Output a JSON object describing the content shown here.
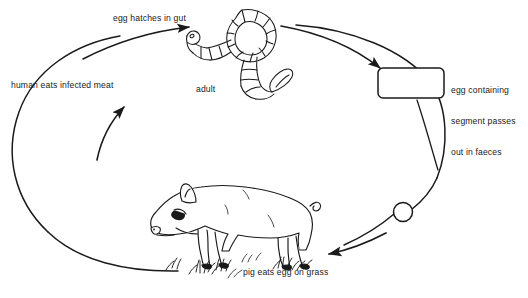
{
  "diagram": {
    "type": "cycle-diagram",
    "background_color": "#ffffff",
    "stroke_color": "#1a1a1a",
    "labels": {
      "egg_hatches": "egg hatches in gut",
      "human_eats": "human eats infected meat",
      "adult": "adult",
      "egg_segment_line1": "egg containing",
      "egg_segment_line2": "segment passes",
      "egg_segment_line3": "out in faeces",
      "pig_eats": "pig eats egg on grass"
    },
    "nodes": [
      {
        "name": "adult-tapeworm",
        "label": "adult",
        "shape": "coiled-segmented-worm"
      },
      {
        "name": "proglottid-segment",
        "label": "egg containing segment passes out in faeces",
        "shape": "rounded-rectangle"
      },
      {
        "name": "tapeworm-egg",
        "label": "",
        "shape": "small-circle"
      },
      {
        "name": "pig",
        "label": "pig eats egg on grass",
        "shape": "pig-illustration"
      }
    ],
    "arrows": [
      {
        "name": "arrow-egg-hatches",
        "label": "egg hatches in gut",
        "direction": "right"
      },
      {
        "name": "arrow-adult-to-segment",
        "label": "",
        "direction": "down-right"
      },
      {
        "name": "arrow-egg-to-pig",
        "label": "pig eats egg on grass",
        "direction": "left"
      },
      {
        "name": "arrow-pig-to-human",
        "label": "human eats infected meat",
        "direction": "up-right"
      }
    ]
  }
}
